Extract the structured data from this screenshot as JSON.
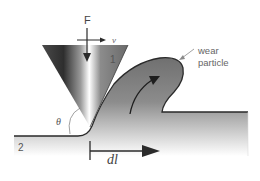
{
  "diagram": {
    "labels": {
      "force": "F",
      "velocity": "v",
      "body_1": "1",
      "body_2": "2",
      "angle": "θ",
      "displacement": "dl",
      "wear_particle_line1": "wear",
      "wear_particle_line2": "particle"
    },
    "elements": [
      {
        "id": "cone-indenter",
        "description": "Inverted conical hard asperity (body 1) with metallic gradient shading"
      },
      {
        "id": "substrate",
        "description": "Softer surface (body 2), gray gradient fading to white at bottom"
      },
      {
        "id": "wear-particle",
        "description": "Curled chip/lip of material rising ahead of the indenter"
      },
      {
        "id": "force-arrow",
        "description": "Downward arrow labeled F on cone axis"
      },
      {
        "id": "velocity-arrow",
        "description": "Horizontal arrow labeled v pointing right"
      },
      {
        "id": "angle-arc",
        "description": "Arc marking cone half-angle θ at tip"
      },
      {
        "id": "curl-arrow",
        "description": "Curved arrow inside particle showing material flow upward"
      },
      {
        "id": "displacement-arrow",
        "description": "Bar-arrow labeled dl indicating sliding distance"
      },
      {
        "id": "leader-line",
        "description": "Thin pointer from 'wear particle' label to particle"
      }
    ],
    "colors": {
      "outline": "#2a2a2a",
      "substrate_top": "#6e6e6e",
      "substrate_bottom": "#f4f4f4",
      "cone_dark": "#3a3a3a",
      "cone_highlight": "#ffffff",
      "arrow": "#2b2b2b",
      "label": "#555555"
    }
  }
}
